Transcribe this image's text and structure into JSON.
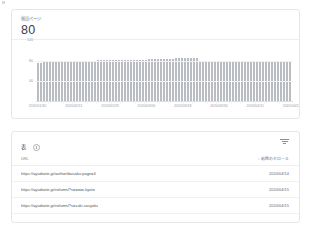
{
  "metric": {
    "label": "検出ページ",
    "value": "80"
  },
  "chart_data": {
    "type": "bar",
    "title": "検出ページ",
    "xlabel": "",
    "ylabel": "",
    "ylim": [
      0,
      120
    ],
    "grid": true,
    "legend": false,
    "ytick_labels": [
      "120",
      "80",
      "40",
      "0"
    ],
    "ytick_values": [
      120,
      80,
      40,
      0
    ],
    "xtick_labels": [
      "2020/01/30",
      "2020/02/11",
      "2020/02/23",
      "2020/03/06",
      "2020/03/18",
      "2020/03/30",
      "2020/04/11",
      "2020/04/23"
    ],
    "categories": [
      "2020/01/30",
      "2020/01/31",
      "2020/02/01",
      "2020/02/02",
      "2020/02/03",
      "2020/02/04",
      "2020/02/05",
      "2020/02/06",
      "2020/02/07",
      "2020/02/08",
      "2020/02/09",
      "2020/02/10",
      "2020/02/11",
      "2020/02/12",
      "2020/02/13",
      "2020/02/14",
      "2020/02/15",
      "2020/02/16",
      "2020/02/17",
      "2020/02/18",
      "2020/02/19",
      "2020/02/20",
      "2020/02/21",
      "2020/02/22",
      "2020/02/23",
      "2020/02/24",
      "2020/02/25",
      "2020/02/26",
      "2020/02/27",
      "2020/02/28",
      "2020/02/29",
      "2020/03/01",
      "2020/03/02",
      "2020/03/03",
      "2020/03/04",
      "2020/03/05",
      "2020/03/06",
      "2020/03/07",
      "2020/03/08",
      "2020/03/09",
      "2020/03/10",
      "2020/03/11",
      "2020/03/12",
      "2020/03/13",
      "2020/03/14",
      "2020/03/15",
      "2020/03/16",
      "2020/03/17",
      "2020/03/18",
      "2020/03/19",
      "2020/03/20",
      "2020/03/21",
      "2020/03/22",
      "2020/03/23",
      "2020/03/24",
      "2020/03/25",
      "2020/03/26",
      "2020/03/27",
      "2020/03/28",
      "2020/03/29",
      "2020/03/30",
      "2020/03/31",
      "2020/04/01",
      "2020/04/02",
      "2020/04/03",
      "2020/04/04",
      "2020/04/05",
      "2020/04/06",
      "2020/04/07",
      "2020/04/08",
      "2020/04/09",
      "2020/04/10",
      "2020/04/11",
      "2020/04/12",
      "2020/04/13",
      "2020/04/14",
      "2020/04/15",
      "2020/04/16",
      "2020/04/17",
      "2020/04/18",
      "2020/04/19",
      "2020/04/20",
      "2020/04/21",
      "2020/04/22",
      "2020/04/23"
    ],
    "values": [
      74,
      74,
      75,
      75,
      75,
      75,
      76,
      76,
      76,
      77,
      77,
      77,
      77,
      77,
      78,
      78,
      78,
      78,
      78,
      78,
      79,
      79,
      79,
      79,
      79,
      79,
      80,
      80,
      80,
      80,
      80,
      80,
      80,
      80,
      80,
      80,
      80,
      81,
      81,
      81,
      81,
      81,
      82,
      82,
      82,
      82,
      83,
      83,
      83,
      83,
      83,
      83,
      83,
      83,
      76,
      76,
      76,
      76,
      76,
      76,
      76,
      76,
      76,
      76,
      76,
      76,
      76,
      76,
      76,
      76,
      77,
      77,
      77,
      77,
      77,
      77,
      77,
      77,
      77,
      76,
      76,
      76,
      76,
      76,
      75
    ]
  },
  "table": {
    "title": "表",
    "info_icon": "info-icon",
    "filter_icon": "filter-icon",
    "columns": {
      "url": "URL",
      "last_crawl": "前回のクロール",
      "sort_arrow": "↓"
    },
    "rows": [
      {
        "url": "https://ayudante.jp/author/daisaku.page=4",
        "date": "2020/04/14"
      },
      {
        "url": "https://ayudante.jp/column/?s=www-kyoto",
        "date": "2020/04/15"
      },
      {
        "url": "https://ayudante.jp/column/?s=suki-sosyoku",
        "date": "2020/04/15"
      }
    ]
  }
}
